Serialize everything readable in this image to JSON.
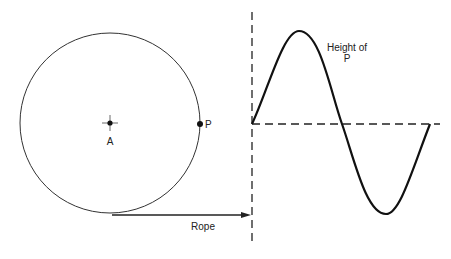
{
  "labels": {
    "center": "A",
    "point": "P",
    "rope": "Rope",
    "height_line1": "Height of",
    "height_line2": "P"
  },
  "colors": {
    "stroke": "#222222",
    "background": "#ffffff"
  }
}
